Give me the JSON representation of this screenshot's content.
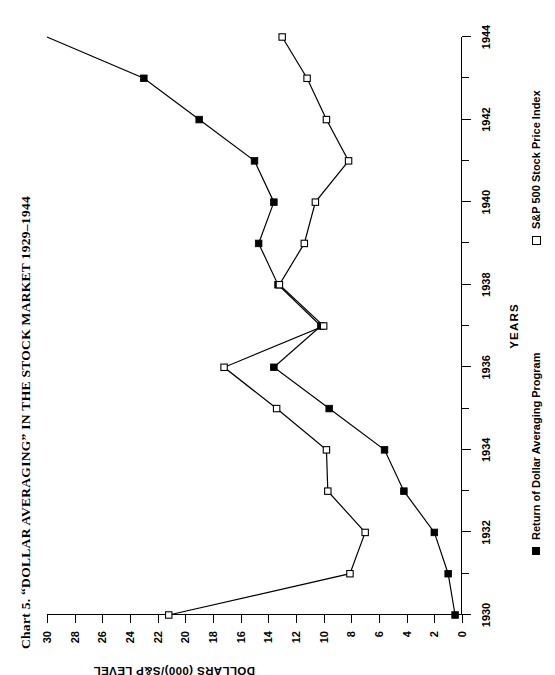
{
  "title": "Chart 5.  “DOLLAR AVERAGING” IN THE STOCK MARKET 1929–1944",
  "axes": {
    "x_title": "YEARS",
    "y_title": "DOLLARS (000)/S&P LEVEL"
  },
  "legend": {
    "items": [
      {
        "label": "Return of Dollar Averaging Program",
        "marker": "filled-square",
        "color": "#000000"
      },
      {
        "label": "S&P 500 Stock Price Index",
        "marker": "open-square",
        "color": "#000000"
      }
    ]
  },
  "chart_data": {
    "type": "line",
    "title": "Chart 5.  “DOLLAR AVERAGING” IN THE STOCK MARKET 1929–1944",
    "xlabel": "YEARS",
    "ylabel": "DOLLARS (000)/S&P LEVEL",
    "xlim": [
      1930,
      1944
    ],
    "ylim": [
      0,
      30
    ],
    "grid": false,
    "legend_position": "bottom",
    "x": [
      1930,
      1931,
      1932,
      1933,
      1934,
      1935,
      1936,
      1937,
      1938,
      1939,
      1940,
      1941,
      1942,
      1943,
      1944
    ],
    "xticks": [
      1930,
      1932,
      1934,
      1936,
      1938,
      1940,
      1942,
      1944
    ],
    "xticklabels": [
      "1930",
      "1932",
      "1934",
      "1936",
      "1938",
      "1940",
      "1942",
      "1944"
    ],
    "yticks": [
      0,
      2,
      4,
      6,
      8,
      10,
      12,
      14,
      16,
      18,
      20,
      22,
      24,
      26,
      28,
      30
    ],
    "yticklabels": [
      "0",
      "2",
      "4",
      "6",
      "8",
      "10",
      "12",
      "14",
      "16",
      "18",
      "20",
      "22",
      "24",
      "26",
      "28",
      "30"
    ],
    "series": [
      {
        "name": "Return of Dollar Averaging Program",
        "marker": "filled-square",
        "color": "#000000",
        "values": [
          0.5,
          1.0,
          2.0,
          4.2,
          5.6,
          9.6,
          13.6,
          10.2,
          13.3,
          14.7,
          13.6,
          15.0,
          19.0,
          23.0,
          30.0
        ]
      },
      {
        "name": "S&P 500 Stock Price Index",
        "marker": "open-square",
        "color": "#000000",
        "values": [
          21.2,
          8.1,
          7.0,
          9.7,
          9.8,
          13.4,
          17.2,
          10.0,
          13.2,
          11.4,
          10.6,
          8.2,
          9.8,
          11.2,
          13.0
        ]
      }
    ]
  }
}
